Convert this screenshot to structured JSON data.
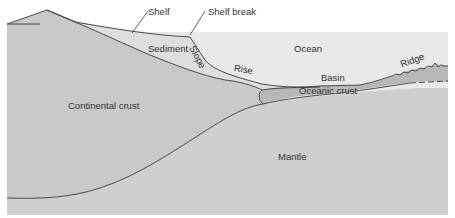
{
  "diagram": {
    "type": "cross-section",
    "labels": {
      "shelf": "Shelf",
      "shelf_break": "Shelf break",
      "sediment": "Sediment",
      "slope": "Slope",
      "ocean": "Ocean",
      "rise": "Rise",
      "basin": "Basin",
      "ridge": "Ridge",
      "oceanic_crust": "Oceanic crust",
      "continental_crust": "Continental crust",
      "mantle": "Mantle"
    },
    "colors": {
      "background": "#ffffff",
      "ocean": "#e8e8e8",
      "sediment": "#dcdcdc",
      "continental_crust": "#c9c9c9",
      "mantle": "#cfcfcf",
      "oceanic_crust": "#b5b5b5",
      "line": "#3a3a3a"
    }
  }
}
